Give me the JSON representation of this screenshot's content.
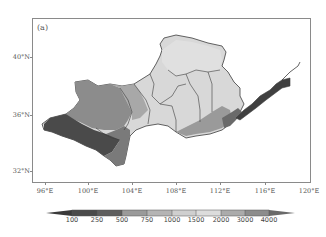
{
  "figure": {
    "panel_label": "(a)",
    "y_axis": {
      "ticks": [
        {
          "label": "40°N",
          "y": 57
        },
        {
          "label": "36°N",
          "y": 115
        },
        {
          "label": "32°N",
          "y": 171
        }
      ]
    },
    "x_axis": {
      "ticks": [
        {
          "label": "96°E",
          "x": 45
        },
        {
          "label": "100°E",
          "x": 88
        },
        {
          "label": "104°E",
          "x": 132
        },
        {
          "label": "108°E",
          "x": 176
        },
        {
          "label": "112°E",
          "x": 220
        },
        {
          "label": "116°E",
          "x": 265
        },
        {
          "label": "120°E",
          "x": 309
        }
      ]
    },
    "colorbar": {
      "levels": [
        "100",
        "250",
        "500",
        "750",
        "1000",
        "1500",
        "2000",
        "3000",
        "4000"
      ],
      "colors": [
        "#3a3a3a",
        "#595959",
        "#6e6e6e",
        "#9a9a9a",
        "#b3b3b3",
        "#d0d0d0",
        "#dcdcdc",
        "#a8a8a8",
        "#8a8a8a",
        "#6a6a6a"
      ]
    },
    "map_colors": {
      "lowland": "#404040",
      "low": "#5a5a5a",
      "mid_low": "#7c7c7c",
      "mid": "#9c9c9c",
      "mid_high": "#bdbdbd",
      "high": "#d4d4d4",
      "plateau": "#dedede",
      "boundary": "#3c3c3c"
    }
  }
}
